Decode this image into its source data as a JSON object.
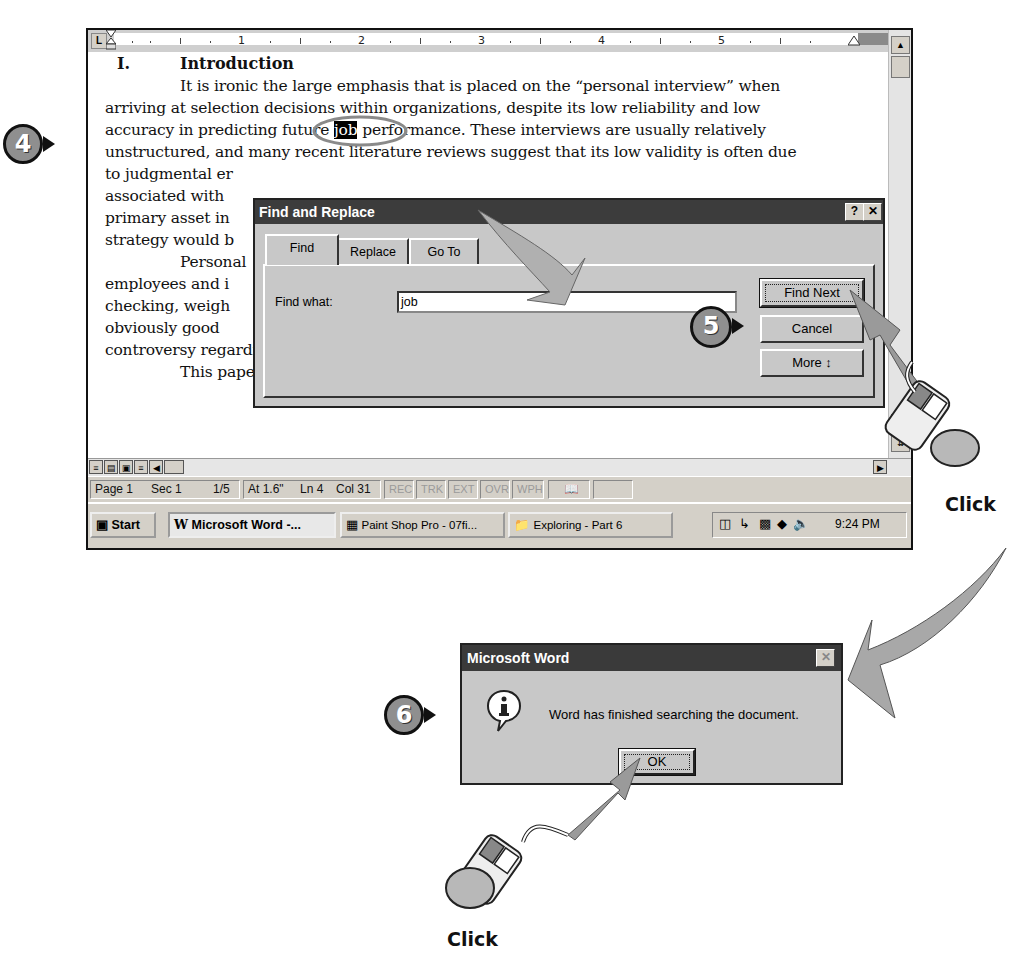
{
  "ruler": {
    "numbers": [
      "1",
      "2",
      "3",
      "4",
      "5"
    ],
    "tab_selector": "L"
  },
  "document": {
    "heading_number": "I.",
    "heading": "Introduction",
    "lines": [
      "It is ironic the large emphasis that is placed on the “personal interview” when",
      "arriving at selection decisions within organizations, despite its low reliability and low",
      "accuracy in predicting future ",
      "job",
      " performance. These interviews are usually relatively",
      "unstructured, and many recent literature reviews suggest that its low validity is often due",
      "to judgmental er",
      "associated with",
      "primary asset in",
      "strategy would b",
      "Personal",
      "employees and i",
      "checking, weigh",
      "obviously good",
      "controversy regarding its validity.",
      "This paper analyzes the validity of the interview - the measure of the degree to"
    ],
    "highlighted_word": "job"
  },
  "find_dialog": {
    "title": "Find and Replace",
    "help_btn": "?",
    "close_btn": "✕",
    "tabs": [
      {
        "label": "Find",
        "active": true
      },
      {
        "label": "Replace",
        "active": false
      },
      {
        "label": "Go To",
        "active": false
      }
    ],
    "find_what_label": "Find what:",
    "find_what_value": "job",
    "buttons": {
      "find_next": "Find Next",
      "cancel": "Cancel",
      "more": "More ↕"
    }
  },
  "statusbar": {
    "page": "Page 1",
    "sec": "Sec 1",
    "pages": "1/5",
    "at": "At 1.6\"",
    "ln": "Ln 4",
    "col": "Col 31",
    "indicators": [
      "REC",
      "TRK",
      "EXT",
      "OVR",
      "WPH"
    ]
  },
  "taskbar": {
    "start": "Start",
    "tasks": [
      {
        "label": "Microsoft Word -...",
        "active": true
      },
      {
        "label": "Paint Shop Pro - 07fi...",
        "active": false
      },
      {
        "label": "Exploring - Part 6",
        "active": false
      }
    ],
    "clock": "9:24 PM"
  },
  "message_box": {
    "title": "Microsoft Word",
    "message": "Word has finished searching the document.",
    "ok": "OK",
    "close_btn": "✕"
  },
  "callouts": {
    "step4": "4",
    "step5": "5",
    "step6": "6",
    "click1": "Click",
    "click2": "Click"
  },
  "colors": {
    "titlebar": "#3c3c3c",
    "dialog_face": "#c8c8c8",
    "badge": "#8f8f8f",
    "arrow": "#a8a8a8"
  }
}
